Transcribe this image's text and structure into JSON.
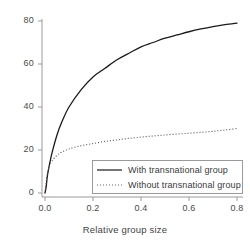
{
  "chart_data": {
    "type": "line",
    "title": "",
    "xlabel": "Relative group size",
    "ylabel": "",
    "xlim": [
      0.0,
      0.8
    ],
    "ylim": [
      0,
      80
    ],
    "grid": false,
    "legend_position": "bottom-right",
    "xticks": [
      "0.0",
      "0.2",
      "0.4",
      "0.6",
      "0.8"
    ],
    "xtick_values": [
      0.0,
      0.2,
      0.4,
      0.6,
      0.8
    ],
    "yticks": [
      "0",
      "20",
      "40",
      "60",
      "80"
    ],
    "ytick_values": [
      0,
      20,
      40,
      60,
      80
    ],
    "x": [
      0.0,
      0.005,
      0.01,
      0.02,
      0.03,
      0.05,
      0.07,
      0.1,
      0.15,
      0.2,
      0.25,
      0.3,
      0.35,
      0.4,
      0.45,
      0.5,
      0.55,
      0.6,
      0.65,
      0.7,
      0.75,
      0.8
    ],
    "series": [
      {
        "name": "With transnational group",
        "style": "solid",
        "color": "#1a1a1a",
        "values": [
          0,
          3,
          8,
          14,
          19,
          27,
          33,
          40,
          48,
          54,
          58,
          62,
          65,
          68,
          70,
          72,
          73.5,
          75,
          76.3,
          77.4,
          78.3,
          79
        ]
      },
      {
        "name": "Without transnational group",
        "style": "dotted",
        "color": "#555555",
        "values": [
          0,
          5,
          9,
          13,
          15,
          17.5,
          19,
          20.5,
          22,
          23,
          24,
          24.7,
          25.4,
          26,
          26.5,
          27,
          27.4,
          27.8,
          28.2,
          28.7,
          29.3,
          30
        ]
      }
    ]
  },
  "legend": {
    "entries": [
      {
        "label": "With transnational group",
        "style": "solid"
      },
      {
        "label": "Without transnational group",
        "style": "dotted"
      }
    ]
  },
  "axis_color": "#9a9a9a",
  "text_color": "#4a4a4a"
}
